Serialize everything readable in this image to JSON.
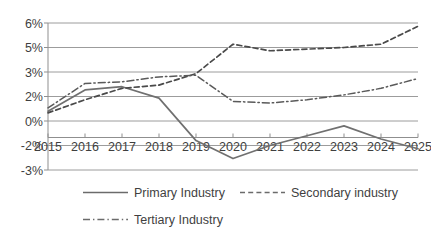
{
  "chart_data": {
    "type": "line",
    "title": "",
    "subtitle": "",
    "xlabel": "",
    "ylabel": "",
    "categories": [
      "2015",
      "2016",
      "2017",
      "2018",
      "2019",
      "2020",
      "2021",
      "2022",
      "2023",
      "2024",
      "2025"
    ],
    "x": [
      2015,
      2016,
      2017,
      2018,
      2019,
      2020,
      2021,
      2022,
      2023,
      2024,
      2025
    ],
    "ylim": [
      -3,
      6
    ],
    "ytick_values": [
      6,
      4.5,
      3,
      1.5,
      0,
      -1.5,
      -3
    ],
    "ytick_labels": [
      "6%",
      "5%",
      "3%",
      "2%",
      "0%",
      "-2%",
      "-3%"
    ],
    "grid": true,
    "legend_position": "bottom",
    "units": "percent",
    "series": [
      {
        "name": "Primary Industry",
        "style": "solid",
        "color": "#707070",
        "values": [
          0.6,
          1.9,
          2.1,
          1.4,
          -1.2,
          -2.3,
          -1.5,
          -0.9,
          -0.3,
          -1.1,
          -1.7
        ]
      },
      {
        "name": "Secondary industry",
        "style": "dashed",
        "color": "#4a4a4a",
        "values": [
          0.5,
          1.3,
          2.0,
          2.2,
          2.9,
          4.7,
          4.3,
          4.4,
          4.5,
          4.7,
          5.8
        ]
      },
      {
        "name": "Tertiary Industry",
        "style": "dash-dot",
        "color": "#5a5a5a",
        "values": [
          0.8,
          2.3,
          2.4,
          2.7,
          2.8,
          1.2,
          1.1,
          1.3,
          1.6,
          2.0,
          2.6
        ]
      }
    ]
  },
  "legend": {
    "items": [
      {
        "label": "Primary Industry",
        "style": "solid"
      },
      {
        "label": "Secondary industry",
        "style": "dashed"
      },
      {
        "label": "Tertiary Industry",
        "style": "dash-dot"
      }
    ]
  },
  "colors": {
    "gridline": "#9c9c9c",
    "axis": "#8f8f8f",
    "text": "#3f3f3f",
    "background": "#ffffff"
  }
}
